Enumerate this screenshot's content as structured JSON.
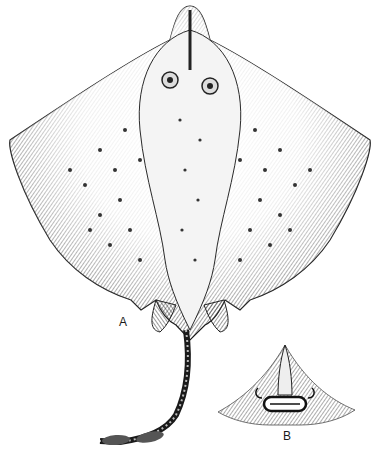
{
  "figure": {
    "labels": {
      "a": "A",
      "b": "B"
    },
    "colors": {
      "ink": "#1a1a1a",
      "mid": "#6a6a6a",
      "paper": "#ffffff"
    }
  }
}
